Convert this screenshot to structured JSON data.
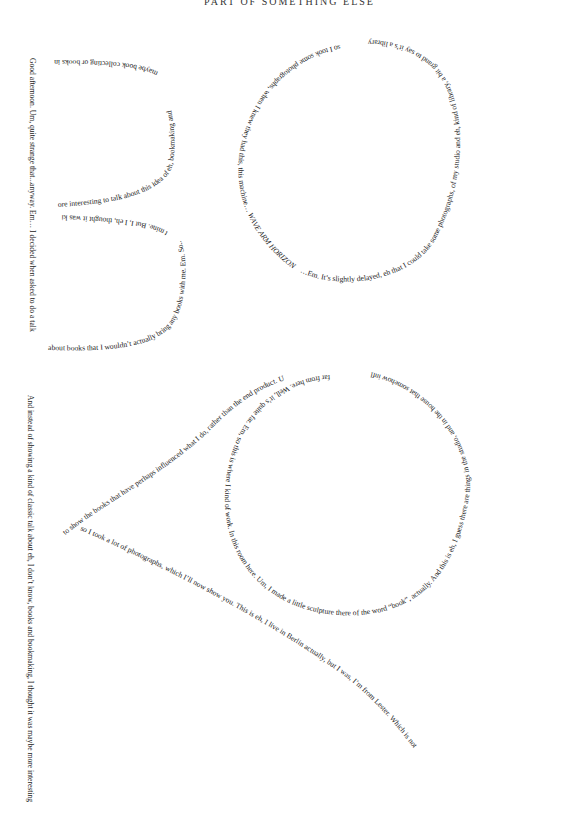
{
  "header": {
    "title": "PART OF SOMETHING ELSE"
  },
  "text_b_shape": {
    "left_vertical": "Good afternoon. Um, quite strange that...anyway. Em… I decided when asked to do a talk",
    "bottom_curve": "about books that I wouldn’t actually bring any books with me. Em. So...these came",
    "middle_curve": "t mine. But I, I eh, thought it was kind of m",
    "middle_upper": "ore interesting to talk about this idea of eh, bookmaking and",
    "top_curve": "maybe book collecting or books in general, um"
  },
  "text_o_shape": {
    "left_part": "so I took some photographs, when I knew they had this, this machine… ",
    "italic_part": "WAVE ARM HORIZONTALLY OVER THE DESK",
    "bottom_part": "…Em. It’s slightly delayed, eh that I could take some photographs, of my studio and eh, kind of library, a bit grand to say it’s a library because it’s a complete mess, um."
  },
  "text_a_shape": {
    "diagonal_upper": "to show the books that have perhaps influenced what I do, rather than the end product. Um",
    "diagonal_lower": "so I took a lot of photographs, which I’ll now show you. This is eh, I live in Berlin actually, but I was, I’m from Lester. Which is not",
    "circle_text": "far from here. Well, it’s quite far. Em, so this is where I kind of work. In this room here. Um, I made a little sculpture there of the word “book”, actually. And this is eh, I guess there are things in the studio, and in the house that somehow influence what I do. And eh, that’s really, kind of, my idea of doing the talk—",
    "left_vertical": "And instead of showing a kind of classic talk about eh, I don’t know, books and bookmaking, I thought it was maybe more interesting"
  }
}
